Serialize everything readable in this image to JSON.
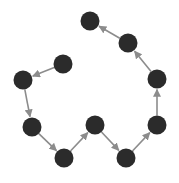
{
  "diagram": {
    "type": "directed-path-graph",
    "node_color": "#2b2b2b",
    "edge_color": "#8c8c8c",
    "node_radius": 9.5,
    "nodes": [
      {
        "id": "n1",
        "x": 63,
        "y": 64
      },
      {
        "id": "n2",
        "x": 23,
        "y": 80
      },
      {
        "id": "n3",
        "x": 32,
        "y": 127
      },
      {
        "id": "n4",
        "x": 64,
        "y": 158
      },
      {
        "id": "n5",
        "x": 95,
        "y": 125
      },
      {
        "id": "n6",
        "x": 126,
        "y": 158
      },
      {
        "id": "n7",
        "x": 157,
        "y": 125
      },
      {
        "id": "n8",
        "x": 157,
        "y": 79
      },
      {
        "id": "n9",
        "x": 128,
        "y": 43
      },
      {
        "id": "n10",
        "x": 90,
        "y": 21
      }
    ],
    "edges": [
      {
        "from": "n1",
        "to": "n2"
      },
      {
        "from": "n2",
        "to": "n3"
      },
      {
        "from": "n3",
        "to": "n4"
      },
      {
        "from": "n4",
        "to": "n5"
      },
      {
        "from": "n5",
        "to": "n6"
      },
      {
        "from": "n6",
        "to": "n7"
      },
      {
        "from": "n7",
        "to": "n8"
      },
      {
        "from": "n8",
        "to": "n9"
      },
      {
        "from": "n9",
        "to": "n10"
      }
    ]
  }
}
